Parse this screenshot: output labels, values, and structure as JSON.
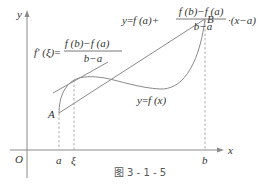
{
  "diagram": {
    "axes": {
      "x_label": "x",
      "y_label": "y",
      "origin_label": "O"
    },
    "ticks": {
      "a": "a",
      "xi": "ξ",
      "b": "b"
    },
    "points": {
      "A": "A",
      "B": "B"
    },
    "curve_label": {
      "lhs": "y",
      "eq": "=",
      "rhs": "f (x)"
    },
    "tangent_formula": {
      "lhs": "f′ (ξ)",
      "eq": "=",
      "numerator": "f (b)−f (a)",
      "denominator": "b−a"
    },
    "secant_formula": {
      "lhs": "y",
      "eq": "=",
      "term1": "f (a)+",
      "numerator": "f (b)−f (a)",
      "denominator": "b−a",
      "term2": "·(x−a)"
    },
    "caption": "图 3 - 1 - 5",
    "colors": {
      "line": "#8a8a8a",
      "text": "#333333"
    }
  }
}
